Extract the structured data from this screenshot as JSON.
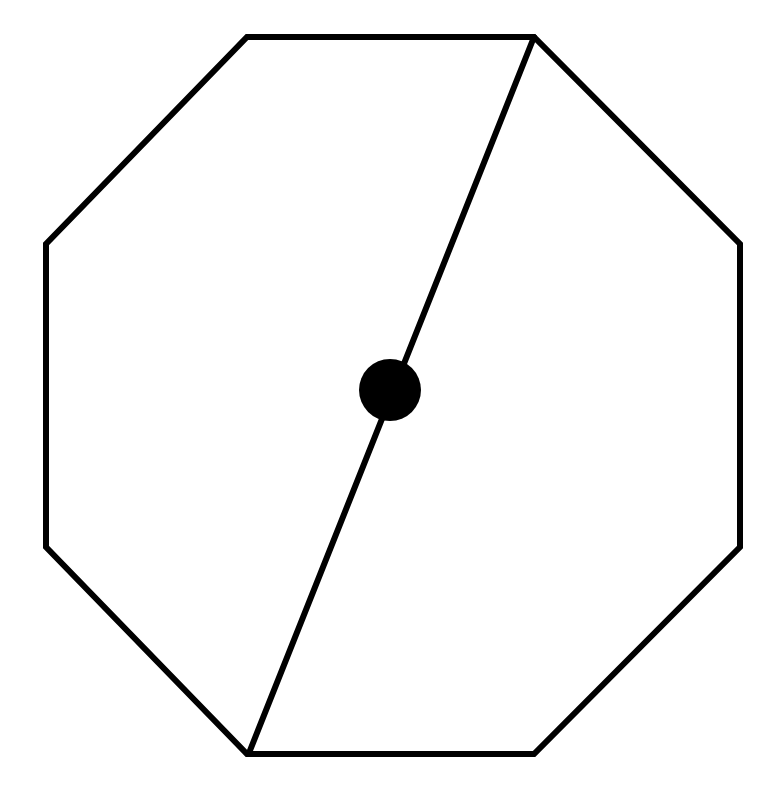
{
  "diagram": {
    "title": "Octagon with diagonal through center point",
    "stroke_color": "#000000",
    "fill_color": "#ffffff",
    "stroke_width": 6,
    "octagon": {
      "vertices": [
        [
          247,
          37
        ],
        [
          534,
          37
        ],
        [
          740,
          244
        ],
        [
          740,
          547
        ],
        [
          534,
          754
        ],
        [
          247,
          754
        ],
        [
          46,
          547
        ],
        [
          46,
          244
        ]
      ]
    },
    "diagonal": {
      "x1": 534,
      "y1": 37,
      "x2": 249,
      "y2": 753
    },
    "center_point": {
      "cx": 390,
      "cy": 390,
      "r": 31
    }
  }
}
